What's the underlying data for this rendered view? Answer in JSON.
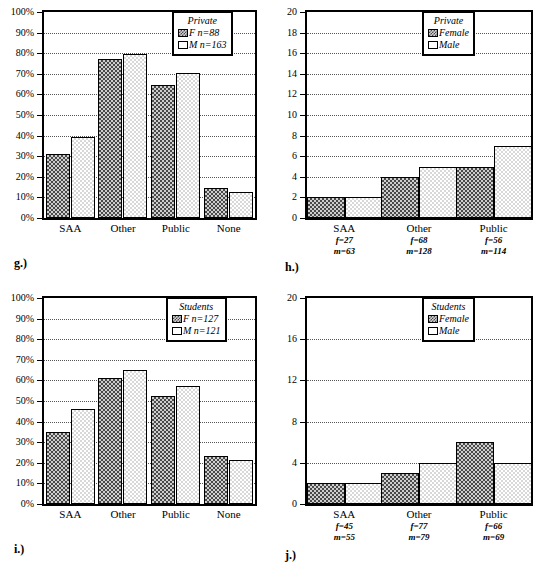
{
  "figure": {
    "panels": [
      "g.)",
      "h.)",
      "i.)",
      "j.)"
    ]
  },
  "panel_g": {
    "caption": "g.)",
    "legend": {
      "title": "Private",
      "series": [
        {
          "key": "female",
          "label": "F n=88"
        },
        {
          "key": "male",
          "label": "M n=163"
        }
      ]
    },
    "yticks": [
      "0%",
      "10%",
      "20%",
      "30%",
      "40%",
      "50%",
      "60%",
      "70%",
      "80%",
      "90%",
      "100%"
    ],
    "xticks": [
      "SAA",
      "Other",
      "Public",
      "None"
    ]
  },
  "panel_h": {
    "caption": "h.)",
    "legend": {
      "title": "Private",
      "series": [
        {
          "key": "female",
          "label": "Female"
        },
        {
          "key": "male",
          "label": "Male"
        }
      ]
    },
    "yticks": [
      "0",
      "2",
      "4",
      "6",
      "8",
      "10",
      "12",
      "14",
      "16",
      "18",
      "20"
    ],
    "xticks": [
      {
        "cat": "SAA",
        "f": "f=27",
        "m": "m=63"
      },
      {
        "cat": "Other",
        "f": "f=68",
        "m": "m=128"
      },
      {
        "cat": "Public",
        "f": "f=56",
        "m": "m=114"
      }
    ]
  },
  "panel_i": {
    "caption": "i.)",
    "legend": {
      "title": "Students",
      "series": [
        {
          "key": "female",
          "label": "F n=127"
        },
        {
          "key": "male",
          "label": "M n=121"
        }
      ]
    },
    "yticks": [
      "0%",
      "10%",
      "20%",
      "30%",
      "40%",
      "50%",
      "60%",
      "70%",
      "80%",
      "90%",
      "100%"
    ],
    "xticks": [
      "SAA",
      "Other",
      "Public",
      "None"
    ]
  },
  "panel_j": {
    "caption": "j.)",
    "legend": {
      "title": "Students",
      "series": [
        {
          "key": "female",
          "label": "Female"
        },
        {
          "key": "male",
          "label": "Male"
        }
      ]
    },
    "yticks": [
      "0",
      "4",
      "8",
      "12",
      "16",
      "20"
    ],
    "xticks": [
      {
        "cat": "SAA",
        "f": "f=45",
        "m": "m=55"
      },
      {
        "cat": "Other",
        "f": "f=77",
        "m": "m=79"
      },
      {
        "cat": "Public",
        "f": "f=66",
        "m": "m=69"
      }
    ]
  },
  "chart_data": [
    {
      "id": "g",
      "type": "bar",
      "title": "",
      "panel_label": "g.)",
      "legend_title": "Private",
      "legend_position": "top-right",
      "grid": true,
      "xlabel": "",
      "ylabel": "",
      "ylim": [
        0,
        100
      ],
      "ytick_values": [
        0,
        10,
        20,
        30,
        40,
        50,
        60,
        70,
        80,
        90,
        100
      ],
      "ytick_labels": [
        "0%",
        "10%",
        "20%",
        "30%",
        "40%",
        "50%",
        "60%",
        "70%",
        "80%",
        "90%",
        "100%"
      ],
      "categories": [
        "SAA",
        "Other",
        "Public",
        "None"
      ],
      "series": [
        {
          "name": "F n=88",
          "key": "female",
          "values": [
            31,
            77,
            64.5,
            14.5
          ]
        },
        {
          "name": "M n=163",
          "key": "male",
          "values": [
            39.5,
            79.5,
            70.5,
            12.5
          ]
        }
      ]
    },
    {
      "id": "h",
      "type": "bar",
      "title": "",
      "panel_label": "h.)",
      "legend_title": "Private",
      "legend_position": "top-right",
      "grid": true,
      "xlabel": "",
      "ylabel": "",
      "ylim": [
        0,
        20
      ],
      "ytick_values": [
        0,
        2,
        4,
        6,
        8,
        10,
        12,
        14,
        16,
        18,
        20
      ],
      "ytick_labels": [
        "0",
        "2",
        "4",
        "6",
        "8",
        "10",
        "12",
        "14",
        "16",
        "18",
        "20"
      ],
      "categories": [
        "SAA",
        "Other",
        "Public"
      ],
      "category_notes": [
        {
          "f": "f=27",
          "m": "m=63"
        },
        {
          "f": "f=68",
          "m": "m=128"
        },
        {
          "f": "f=56",
          "m": "m=114"
        }
      ],
      "series": [
        {
          "name": "Female",
          "key": "female",
          "values": [
            2,
            4,
            5
          ]
        },
        {
          "name": "Male",
          "key": "male",
          "values": [
            2,
            5,
            7
          ]
        }
      ]
    },
    {
      "id": "i",
      "type": "bar",
      "title": "",
      "panel_label": "i.)",
      "legend_title": "Students",
      "legend_position": "top-right",
      "grid": true,
      "xlabel": "",
      "ylabel": "",
      "ylim": [
        0,
        100
      ],
      "ytick_values": [
        0,
        10,
        20,
        30,
        40,
        50,
        60,
        70,
        80,
        90,
        100
      ],
      "ytick_labels": [
        "0%",
        "10%",
        "20%",
        "30%",
        "40%",
        "50%",
        "60%",
        "70%",
        "80%",
        "90%",
        "100%"
      ],
      "categories": [
        "SAA",
        "Other",
        "Public",
        "None"
      ],
      "series": [
        {
          "name": "F n=127",
          "key": "female",
          "values": [
            35,
            61,
            52.5,
            23.5
          ]
        },
        {
          "name": "M n=121",
          "key": "male",
          "values": [
            46,
            65,
            57.5,
            21.5
          ]
        }
      ]
    },
    {
      "id": "j",
      "type": "bar",
      "title": "",
      "panel_label": "j.)",
      "legend_title": "Students",
      "legend_position": "top-right",
      "grid": true,
      "xlabel": "",
      "ylabel": "",
      "ylim": [
        0,
        20
      ],
      "ytick_values": [
        0,
        4,
        8,
        12,
        16,
        20
      ],
      "ytick_labels": [
        "0",
        "4",
        "8",
        "12",
        "16",
        "20"
      ],
      "categories": [
        "SAA",
        "Other",
        "Public"
      ],
      "category_notes": [
        {
          "f": "f=45",
          "m": "m=55"
        },
        {
          "f": "f=77",
          "m": "m=79"
        },
        {
          "f": "f=66",
          "m": "m=69"
        }
      ],
      "series": [
        {
          "name": "Female",
          "key": "female",
          "values": [
            2,
            3,
            6
          ]
        },
        {
          "name": "Male",
          "key": "male",
          "values": [
            2,
            4,
            4
          ]
        }
      ]
    }
  ]
}
